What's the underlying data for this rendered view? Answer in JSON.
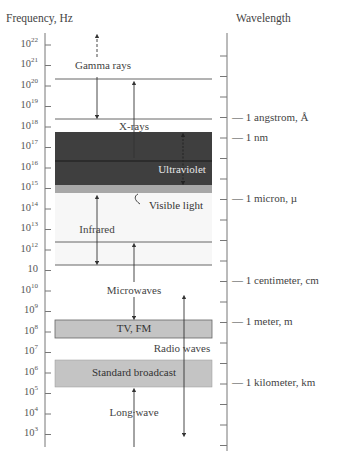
{
  "axes": {
    "frequency_title": "Frequency, Hz",
    "wavelength_title": "Wavelength"
  },
  "frequency_ticks": [
    {
      "base": "10",
      "exp": "22"
    },
    {
      "base": "10",
      "exp": "21"
    },
    {
      "base": "10",
      "exp": "20"
    },
    {
      "base": "10",
      "exp": "19"
    },
    {
      "base": "10",
      "exp": "18"
    },
    {
      "base": "10",
      "exp": "17"
    },
    {
      "base": "10",
      "exp": "16"
    },
    {
      "base": "10",
      "exp": "15"
    },
    {
      "base": "10",
      "exp": "14"
    },
    {
      "base": "10",
      "exp": "13"
    },
    {
      "base": "10",
      "exp": "12"
    },
    {
      "base": "10",
      "exp": ""
    },
    {
      "base": "10",
      "exp": "10"
    },
    {
      "base": "10",
      "exp": "9"
    },
    {
      "base": "10",
      "exp": "8"
    },
    {
      "base": "10",
      "exp": "7"
    },
    {
      "base": "10",
      "exp": "6"
    },
    {
      "base": "10",
      "exp": "5"
    },
    {
      "base": "10",
      "exp": "4"
    },
    {
      "base": "10",
      "exp": "3"
    }
  ],
  "bands": {
    "gamma": "Gamma rays",
    "xrays": "X-rays",
    "ultraviolet": "Ultraviolet",
    "visible": "Visible light",
    "infrared": "Infrared",
    "microwaves": "Microwaves",
    "tvfm": "TV, FM",
    "radio": "Radio waves",
    "broadcast": "Standard broadcast",
    "longwave": "Long wave"
  },
  "wavelength_labels": {
    "angstrom": "— 1 angstrom, Å",
    "nm": "— 1 nm",
    "micron": "— 1 micron, µ",
    "centimeter": "— 1 centimeter, cm",
    "meter": "— 1 meter, m",
    "kilometer": "— 1 kilometer, km"
  },
  "colors": {
    "ultraviolet_fill": "#3f3f3f",
    "visible_fill": "#a8a8a8",
    "tv_fill": "#c4c4c4",
    "broadcast_fill": "#c4c4c4",
    "line": "#555555"
  }
}
